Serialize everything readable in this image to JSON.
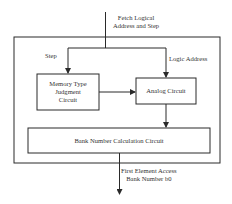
{
  "diagram": {
    "input_label_line1": "Fetch Logical",
    "input_label_line2": "Address and Step",
    "step_label": "Step",
    "logic_address_label": "Logic Address",
    "memory_type_line1": "Memory Type",
    "memory_type_line2": "Judgment",
    "memory_type_line3": "Circuit",
    "analog_circuit": "Analog Circuit",
    "bank_number_circuit": "Bank Number Calculation Circuit",
    "output_label_line1": "First Element Access",
    "output_label_line2": "Bank Number b0"
  },
  "colors": {
    "stroke": "#2a2a2a",
    "background": "#ffffff"
  }
}
